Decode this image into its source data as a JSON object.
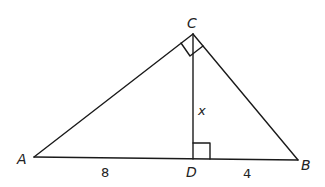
{
  "diagram": {
    "stroke_color": "#1a1a1a",
    "points": {
      "A": {
        "label": "A",
        "x": 34,
        "y": 157
      },
      "B": {
        "label": "B",
        "x": 298,
        "y": 160
      },
      "C": {
        "label": "C",
        "x": 193,
        "y": 34
      },
      "D": {
        "label": "D",
        "x": 193,
        "y": 159
      }
    },
    "segments": [
      {
        "from": "A",
        "to": "B"
      },
      {
        "from": "A",
        "to": "C"
      },
      {
        "from": "C",
        "to": "B"
      },
      {
        "from": "C",
        "to": "D"
      }
    ],
    "right_angles": [
      "C",
      "D"
    ],
    "measures": {
      "AD": "8",
      "DB": "4",
      "CD": "x"
    }
  }
}
